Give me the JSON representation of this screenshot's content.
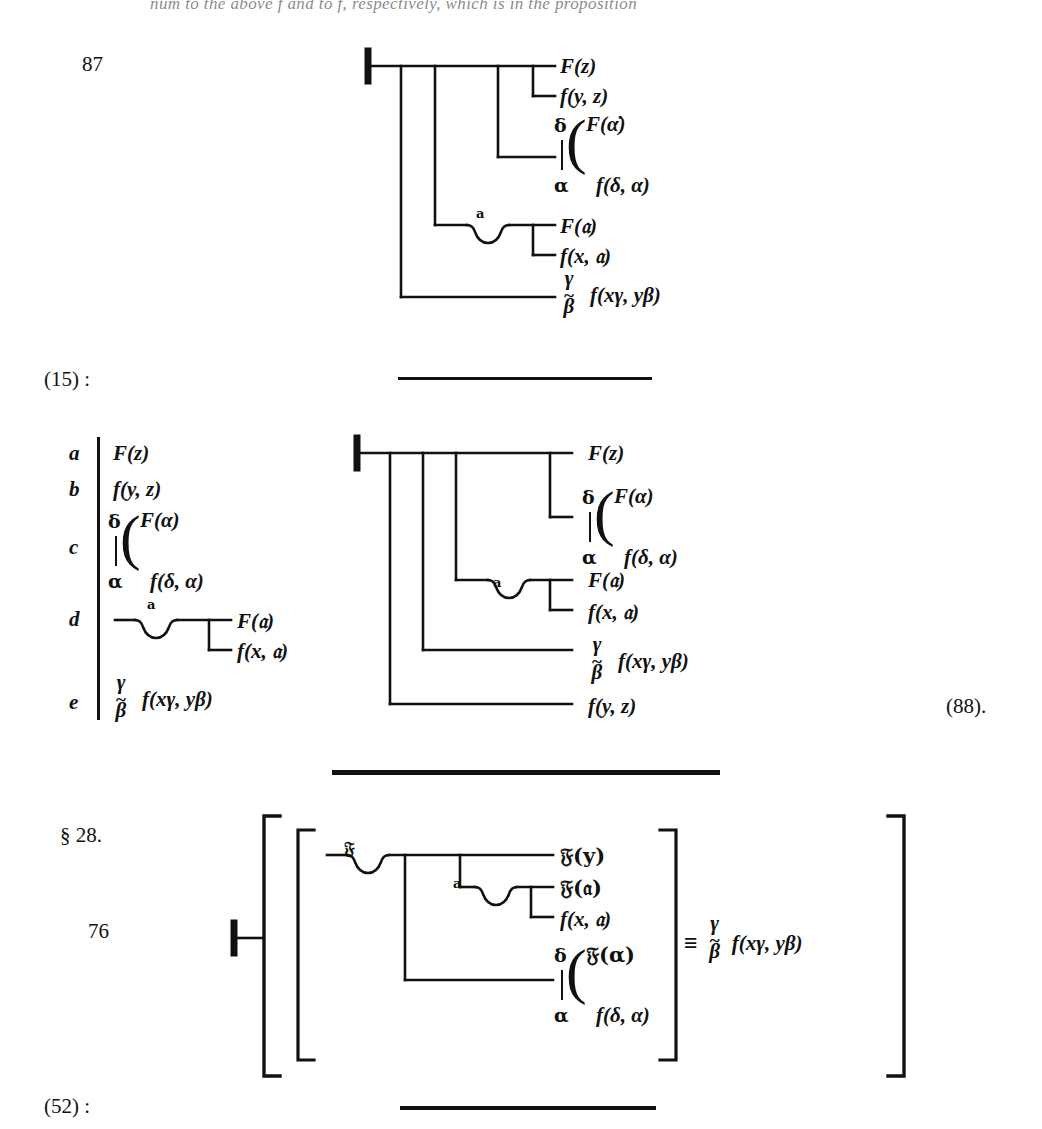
{
  "page": {
    "cut_text_top": "num to the above f and to f, respectively, which is in the proposition",
    "background": "#ffffff",
    "ink": "#111111"
  },
  "blocks": [
    {
      "id": "block-87",
      "number": "87",
      "kind": "begriffsschrift-judgment",
      "lines": [
        {
          "label": "F(z)"
        },
        {
          "label": "f(y, z)"
        },
        {
          "label_upper": "F(α̇)",
          "label_lower": "f(δ, α)",
          "operator": "delta-alpha"
        },
        {
          "label": "F(𝔞)",
          "quantifier": "a"
        },
        {
          "label": "f(x, 𝔞)"
        },
        {
          "label": "f(xγ, yβ)",
          "operator": "gamma-beta"
        }
      ]
    },
    {
      "id": "ref-15",
      "reference": "(15) :"
    },
    {
      "id": "legend-abcde",
      "rows": [
        {
          "key": "a",
          "label": "F(z)"
        },
        {
          "key": "b",
          "label": "f(y, z)"
        },
        {
          "key": "c",
          "label_upper": "F(α)",
          "label_lower": "f(δ, α)",
          "operator": "delta-alpha"
        },
        {
          "key": "d",
          "label_upper": "F(𝔞)",
          "label_lower": "f(x, 𝔞)",
          "quantifier": "a"
        },
        {
          "key": "e",
          "label": "f(xγ, yβ)",
          "operator": "gamma-beta"
        }
      ]
    },
    {
      "id": "block-88",
      "kind": "begriffsschrift-judgment",
      "reference": "(88).",
      "lines": [
        {
          "label": "F(z)"
        },
        {
          "label_upper": "F(α)",
          "label_lower": "f(δ, α)",
          "operator": "delta-alpha"
        },
        {
          "label": "F(𝔞)",
          "quantifier": "a"
        },
        {
          "label": "f(x, 𝔞)"
        },
        {
          "label": "f(xγ, yβ)",
          "operator": "gamma-beta"
        },
        {
          "label": "f(y, z)"
        }
      ]
    },
    {
      "id": "block-76",
      "section": "§ 28.",
      "number": "76",
      "kind": "begriffsschrift-definition",
      "lines": [
        {
          "label": "𝔉(y)",
          "quantifier": "𝔉"
        },
        {
          "label": "𝔉(𝔞)",
          "quantifier": "a"
        },
        {
          "label": "f(x, 𝔞)"
        },
        {
          "label_upper": "𝔉(α)",
          "label_lower": "f(δ, α)",
          "operator": "delta-alpha"
        }
      ],
      "equiv_symbol": "≡",
      "equiv_label": "f(xγ, yβ)",
      "equiv_operator": "gamma-beta"
    },
    {
      "id": "ref-52",
      "reference": "(52) :"
    }
  ],
  "rules": [
    {
      "id": "rule-1",
      "thickness": "thin"
    },
    {
      "id": "rule-2",
      "thickness": "thick"
    },
    {
      "id": "rule-3",
      "thickness": "thin"
    }
  ]
}
